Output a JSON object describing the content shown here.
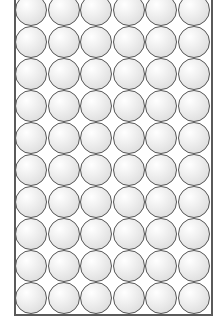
{
  "diagram": {
    "type": "sphere-packing-square-lattice",
    "columns": 6,
    "rows": 10,
    "colors": {
      "background": "#ffffff",
      "sphere_outline": "#555555",
      "sphere_highlight": "#ffffff",
      "sphere_shadow": "#cfcfcf",
      "container_border": "#5a5a5a"
    }
  }
}
